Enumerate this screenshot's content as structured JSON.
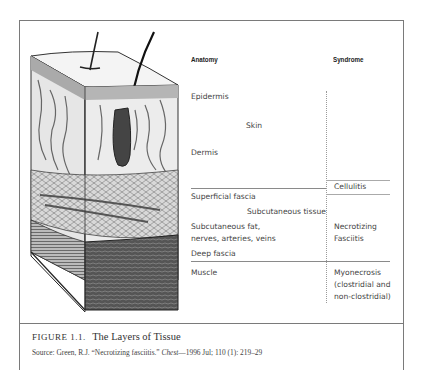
{
  "figure": {
    "label": "FIGURE 1.1.",
    "title": "The Layers of Tissue",
    "source_prefix": "Source: Green, R.J. “Necrotizing fasciitis.” ",
    "source_journal": "Chest",
    "source_suffix": "—1996 Jul; 110 (1): 219–29"
  },
  "illustration": {
    "description": "Cross-section drawing of skin layers with hair follicle, blood vessels, fat and muscle"
  },
  "table": {
    "headers": {
      "anatomy": "Anatomy",
      "syndrome": "Syndrome"
    },
    "anatomy": {
      "epidermis": "Epidermis",
      "skin": "Skin",
      "dermis": "Dermis",
      "superficial_fascia": "Superficial fascia",
      "subcutaneous_tissue": "Subcutaneous tissue",
      "subcutaneous_fat_1": "Subcutaneous fat,",
      "subcutaneous_fat_2": "nerves, arteries, veins",
      "deep_fascia": "Deep fascia",
      "muscle": "Muscle"
    },
    "syndrome": {
      "cellulitis": "Cellulitis",
      "necrotizing_1": "Necrotizing",
      "necrotizing_2": "Fasciitis",
      "myonecrosis_1": "Myonecrosis",
      "myonecrosis_2": "(clostridial and",
      "myonecrosis_3": "non-clostridial)"
    }
  }
}
